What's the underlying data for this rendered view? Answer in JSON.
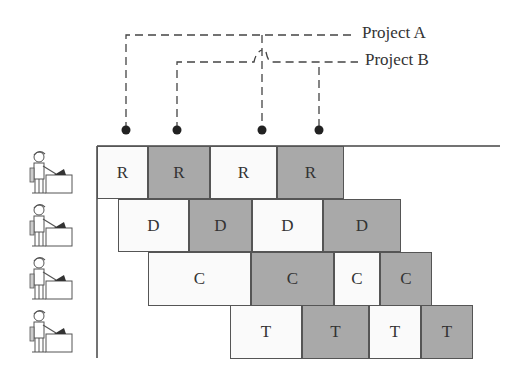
{
  "projects": [
    {
      "label": "Project A",
      "line_y": 35,
      "label_x": 362,
      "label_y": 22,
      "dots_x": [
        126,
        262
      ],
      "line_start_x": 126,
      "line_end_x": 355
    },
    {
      "label": "Project B",
      "line_y": 62,
      "label_x": 365,
      "label_y": 62,
      "dots_x": [
        177,
        319
      ],
      "line_start_x": 177,
      "line_end_x": 358
    }
  ],
  "dot_y": 130,
  "colors": {
    "light": "#fafafa",
    "dark": "#a9a9a9",
    "border": "#555555",
    "line": "#444444"
  },
  "rows": [
    {
      "worker": "worker-requirements",
      "top": 146,
      "height": 53,
      "cells": [
        {
          "label": "R",
          "x": 97,
          "w": 51,
          "shade": "light"
        },
        {
          "label": "R",
          "x": 148,
          "w": 62,
          "shade": "dark"
        },
        {
          "label": "R",
          "x": 210,
          "w": 67,
          "shade": "light"
        },
        {
          "label": "R",
          "x": 277,
          "w": 67,
          "shade": "dark"
        }
      ]
    },
    {
      "worker": "worker-design",
      "top": 199,
      "height": 53,
      "cells": [
        {
          "label": "D",
          "x": 118,
          "w": 71,
          "shade": "light"
        },
        {
          "label": "D",
          "x": 189,
          "w": 63,
          "shade": "dark"
        },
        {
          "label": "D",
          "x": 252,
          "w": 71,
          "shade": "light"
        },
        {
          "label": "D",
          "x": 323,
          "w": 78,
          "shade": "dark"
        }
      ]
    },
    {
      "worker": "worker-coding",
      "top": 252,
      "height": 54,
      "cells": [
        {
          "label": "C",
          "x": 148,
          "w": 103,
          "shade": "light"
        },
        {
          "label": "C",
          "x": 251,
          "w": 83,
          "shade": "dark"
        },
        {
          "label": "C",
          "x": 334,
          "w": 46,
          "shade": "light"
        },
        {
          "label": "C",
          "x": 380,
          "w": 52,
          "shade": "dark"
        }
      ]
    },
    {
      "worker": "worker-testing",
      "top": 305,
      "height": 54,
      "cells": [
        {
          "label": "T",
          "x": 230,
          "w": 72,
          "shade": "light"
        },
        {
          "label": "T",
          "x": 302,
          "w": 67,
          "shade": "dark"
        },
        {
          "label": "T",
          "x": 369,
          "w": 52,
          "shade": "light"
        },
        {
          "label": "T",
          "x": 421,
          "w": 52,
          "shade": "dark"
        }
      ]
    }
  ]
}
